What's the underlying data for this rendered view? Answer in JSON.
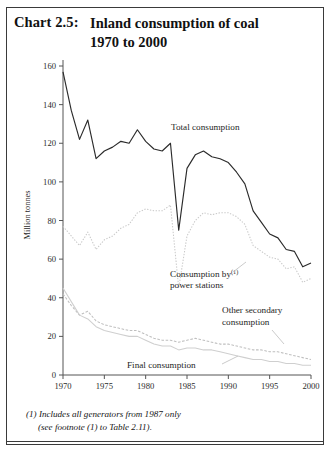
{
  "header": {
    "chart_number": "Chart 2.5:",
    "title_line1": "Inland consumption of coal",
    "title_line2": "1970 to 2000"
  },
  "footnote": {
    "line1": "(1) Includes all generators from 1987 only",
    "line2": "(see footnote (1) to Table 2.11)."
  },
  "annotations": {
    "total": "Total consumption",
    "power_1": "Consumption by",
    "power_sup": "(1)",
    "power_2": "power stations",
    "other_1": "Other secondary",
    "other_2": "consumption",
    "final": "Final consumption"
  },
  "colors": {
    "total_line": "#2b2b2b",
    "power_line": "#c9c9c9",
    "other_line": "#bfbfbf",
    "final_line": "#cfcfcf",
    "axis": "#555555",
    "frame": "#3a3a3a",
    "text": "#111111"
  },
  "chart_data": {
    "type": "line",
    "title": "Inland consumption of coal 1970 to 2000",
    "xlabel": "",
    "ylabel": "Million tonnes",
    "xlim": [
      1970,
      2000
    ],
    "ylim": [
      0,
      160
    ],
    "ytick_step": 20,
    "yticks": [
      0,
      20,
      40,
      60,
      80,
      100,
      120,
      140,
      160
    ],
    "xticks": [
      1970,
      1975,
      1980,
      1985,
      1990,
      1995,
      2000
    ],
    "grid": false,
    "legend": "inline-annotations",
    "x": [
      1970,
      1971,
      1972,
      1973,
      1974,
      1975,
      1976,
      1977,
      1978,
      1979,
      1980,
      1981,
      1982,
      1983,
      1984,
      1985,
      1986,
      1987,
      1988,
      1989,
      1990,
      1991,
      1992,
      1993,
      1994,
      1995,
      1996,
      1997,
      1998,
      1999,
      2000
    ],
    "series": [
      {
        "name": "Total consumption",
        "style": "solid",
        "values": [
          157,
          137,
          122,
          132,
          112,
          116,
          118,
          121,
          120,
          127,
          121,
          117,
          116,
          120,
          75,
          107,
          114,
          116,
          113,
          112,
          110,
          105,
          99,
          85,
          79,
          73,
          71,
          65,
          64,
          56,
          58
        ]
      },
      {
        "name": "Consumption by power stations",
        "style": "dotted",
        "values": [
          77,
          72,
          67,
          74,
          65,
          70,
          72,
          76,
          78,
          84,
          86,
          85,
          85,
          88,
          45,
          72,
          80,
          84,
          83,
          84,
          84,
          82,
          78,
          67,
          64,
          61,
          60,
          55,
          56,
          48,
          50
        ]
      },
      {
        "name": "Other secondary consumption",
        "style": "dashed",
        "values": [
          42,
          36,
          31,
          33,
          28,
          26,
          25,
          24,
          23,
          23,
          21,
          19,
          18,
          18,
          17,
          18,
          19,
          18,
          17,
          16,
          16,
          15,
          14,
          13,
          13,
          12,
          12,
          11,
          10,
          9,
          8
        ]
      },
      {
        "name": "Final consumption",
        "style": "solid-light",
        "values": [
          45,
          38,
          31,
          29,
          25,
          23,
          22,
          21,
          20,
          20,
          18,
          16,
          15,
          15,
          13,
          14,
          14,
          13,
          13,
          12,
          11,
          10,
          9,
          8,
          8,
          7,
          7,
          6,
          6,
          5,
          5
        ]
      }
    ]
  }
}
